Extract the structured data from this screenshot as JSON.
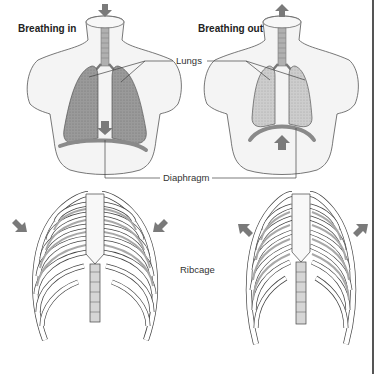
{
  "diagram": {
    "panels": [
      {
        "id": "inhale",
        "title": "Breathing in",
        "diaphragm_arrow": "down",
        "ribcage_arrows": "up-out"
      },
      {
        "id": "exhale",
        "title": "Breathing out",
        "diaphragm_arrow": "up",
        "ribcage_arrows": "down-in"
      }
    ],
    "labels": {
      "lungs": "Lungs",
      "diaphragm": "Diaphragm",
      "ribcage": "Ribcage"
    },
    "colors": {
      "background": "#ffffff",
      "torso_fill": "#f3f3f3",
      "outline": "#555555",
      "lung_fill_in": "#9a9a9a",
      "lung_fill_out": "#c8c8c8",
      "diaphragm": "#8a8a8a",
      "arrow": "#7a7a7a",
      "rib_shade": "#a8a8a8"
    }
  }
}
